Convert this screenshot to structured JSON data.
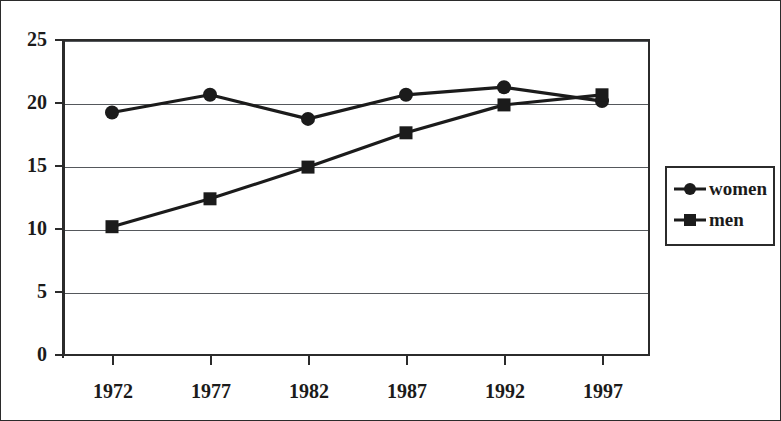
{
  "chart_data": {
    "type": "line",
    "title": "",
    "subtitle": "",
    "xlabel": "",
    "ylabel": "",
    "categories": [
      "1972",
      "1977",
      "1982",
      "1987",
      "1992",
      "1997"
    ],
    "x_tick_labels": [
      "1972",
      "1977",
      "1982",
      "1987",
      "1992",
      "1997"
    ],
    "y_tick_labels": [
      "0",
      "5",
      "10",
      "15",
      "20",
      "25"
    ],
    "y_ticks": [
      0,
      5,
      10,
      15,
      20,
      25
    ],
    "ylim": [
      0,
      25
    ],
    "grid": "horizontal",
    "legend_position": "right",
    "series": [
      {
        "name": "women",
        "marker": "circle",
        "color": "#1b1b1b",
        "values": [
          19.2,
          20.6,
          18.7,
          20.6,
          21.2,
          20.1
        ]
      },
      {
        "name": "men",
        "marker": "square",
        "color": "#1b1b1b",
        "values": [
          10.2,
          12.4,
          14.9,
          17.6,
          19.8,
          20.6
        ]
      }
    ],
    "legend_entries": [
      "women",
      "men"
    ]
  },
  "legend": {
    "entries": [
      {
        "label": "women",
        "marker": "circle-marker-icon"
      },
      {
        "label": "men",
        "marker": "square-marker-icon"
      }
    ]
  },
  "axes": {
    "y_labels": [
      "25",
      "20",
      "15",
      "10",
      "5",
      "0"
    ],
    "x_labels": [
      "1972",
      "1977",
      "1982",
      "1987",
      "1992",
      "1997"
    ]
  }
}
